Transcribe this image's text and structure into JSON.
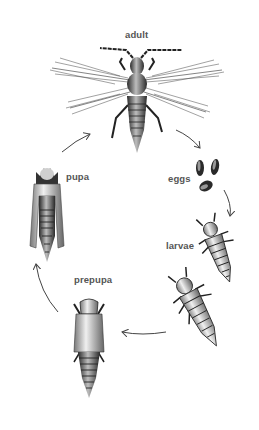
{
  "diagram": {
    "type": "life-cycle",
    "stages": [
      {
        "id": "adult",
        "label": "adult"
      },
      {
        "id": "eggs",
        "label": "eggs"
      },
      {
        "id": "larvae",
        "label": "larvae"
      },
      {
        "id": "prepupa",
        "label": "prepupa"
      },
      {
        "id": "pupa",
        "label": "pupa"
      }
    ],
    "flow": [
      "adult",
      "eggs",
      "larvae",
      "prepupa",
      "pupa",
      "adult"
    ],
    "colors": {
      "background": "#ffffff",
      "label": "#555555",
      "ink": "#222222",
      "arrow": "#444444"
    }
  }
}
